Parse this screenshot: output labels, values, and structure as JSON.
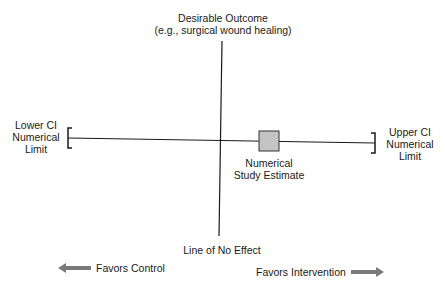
{
  "labels": {
    "top_line1": "Desirable Outcome",
    "top_line2": "(e.g., surgical wound healing)",
    "lower_ci_1": "Lower CI",
    "lower_ci_2": "Numerical",
    "lower_ci_3": "Limit",
    "upper_ci_1": "Upper CI",
    "upper_ci_2": "Numerical",
    "upper_ci_3": "Limit",
    "estimate_1": "Numerical",
    "estimate_2": "Study Estimate",
    "no_effect": "Line of No Effect",
    "favors_control": "Favors Control",
    "favors_intervention": "Favors Intervention"
  },
  "icons": {
    "left_arrow": "arrow-left-icon",
    "right_arrow": "arrow-right-icon"
  },
  "colors": {
    "line": "#1a1a1a",
    "estimate_fill": "#c4c4c4",
    "arrow": "#7a7a7a"
  }
}
